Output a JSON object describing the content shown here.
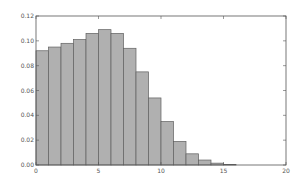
{
  "chart_data": {
    "type": "bar",
    "title": "",
    "xlabel": "",
    "ylabel": "",
    "xlim": [
      0,
      20
    ],
    "ylim": [
      0,
      0.12
    ],
    "grid": false,
    "legend": null,
    "x_ticks": [
      "0",
      "5",
      "10",
      "15",
      "20"
    ],
    "y_ticks": [
      "0.00",
      "0.02",
      "0.04",
      "0.06",
      "0.08",
      "0.10",
      "0.12"
    ],
    "bin_edges": [
      0,
      1,
      2,
      3,
      4,
      5,
      6,
      7,
      8,
      9,
      10,
      11,
      12,
      13,
      14,
      15,
      16
    ],
    "categories": [
      "0-1",
      "1-2",
      "2-3",
      "3-4",
      "4-5",
      "5-6",
      "6-7",
      "7-8",
      "8-9",
      "9-10",
      "10-11",
      "11-12",
      "12-13",
      "13-14",
      "14-15",
      "15-16"
    ],
    "values": [
      0.092,
      0.095,
      0.098,
      0.101,
      0.106,
      0.109,
      0.106,
      0.094,
      0.075,
      0.054,
      0.035,
      0.019,
      0.009,
      0.004,
      0.0015,
      0.0005
    ],
    "bar_color": "#b0b0b0",
    "edge_color": "#606060"
  }
}
